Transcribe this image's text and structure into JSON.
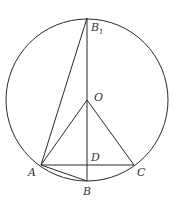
{
  "diagram": {
    "type": "circle-geometry",
    "stroke_color": "#2a2a2a",
    "circle": {
      "center": "O",
      "cx": 87,
      "cy": 100,
      "r": 81
    },
    "points": {
      "B1": {
        "x": 87,
        "y": 18,
        "label": "B",
        "subscript": "1"
      },
      "O": {
        "x": 87,
        "y": 100,
        "label": "O"
      },
      "A": {
        "x": 41,
        "y": 165,
        "label": "A"
      },
      "C": {
        "x": 134,
        "y": 165,
        "label": "C"
      },
      "D": {
        "x": 87,
        "y": 165,
        "label": "D"
      },
      "B": {
        "x": 87,
        "y": 181,
        "label": "B"
      }
    },
    "segments": [
      [
        "B1",
        "B"
      ],
      [
        "A",
        "B1"
      ],
      [
        "O",
        "A"
      ],
      [
        "O",
        "C"
      ],
      [
        "A",
        "C"
      ],
      [
        "A",
        "B"
      ]
    ]
  }
}
